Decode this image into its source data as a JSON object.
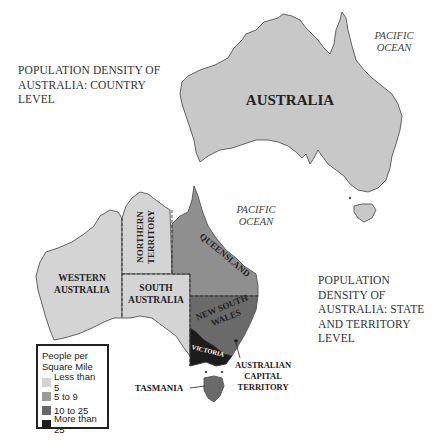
{
  "top_map": {
    "title_lines": [
      "POPULATION DENSITY OF",
      "AUSTRALIA: COUNTRY",
      "LEVEL"
    ],
    "country_label": "AUSTRALIA",
    "ocean_label_lines": [
      "PACIFIC",
      "OCEAN"
    ],
    "fill_color": "#c8c8c8"
  },
  "bottom_map": {
    "title_lines": [
      "POPULATION",
      "DENSITY OF",
      "AUSTRALIA: STATE",
      "AND TERRITORY",
      "LEVEL"
    ],
    "ocean_label_lines": [
      "PACIFIC",
      "OCEAN"
    ],
    "regions": [
      {
        "name_lines": [
          "WESTERN",
          "AUSTRALIA"
        ],
        "density_class": "Less than 5",
        "color": "#d4d4d4"
      },
      {
        "name_lines": [
          "NORTHERN",
          "TERRITORY"
        ],
        "density_class": "Less than 5",
        "color": "#d4d4d4"
      },
      {
        "name_lines": [
          "SOUTH",
          "AUSTRALIA"
        ],
        "density_class": "Less than 5",
        "color": "#d4d4d4"
      },
      {
        "name_lines": [
          "QUEENSLAND"
        ],
        "density_class": "5 to 9",
        "color": "#8f8f8f"
      },
      {
        "name_lines": [
          "NEW SOUTH",
          "WALES"
        ],
        "density_class": "10 to 25",
        "color": "#6a6a6a"
      },
      {
        "name_lines": [
          "VICTORIA"
        ],
        "density_class": "More than 25",
        "color": "#1c1c1c"
      },
      {
        "name_lines": [
          "TASMANIA"
        ],
        "density_class": "10 to 25",
        "color": "#6a6a6a"
      },
      {
        "name_lines": [
          "AUSTRALIAN",
          "CAPITAL",
          "TERRITORY"
        ],
        "density_class": "More than 25",
        "color": "#1c1c1c"
      }
    ],
    "legend": {
      "title_lines": [
        "People per",
        "Square Mile"
      ],
      "items": [
        {
          "label": "Less than 5",
          "color": "#d4d4d4"
        },
        {
          "label": "5 to 9",
          "color": "#9a9a9a"
        },
        {
          "label": "10 to 25",
          "color": "#666666"
        },
        {
          "label": "More than 25",
          "color": "#1c1c1c"
        }
      ]
    }
  }
}
